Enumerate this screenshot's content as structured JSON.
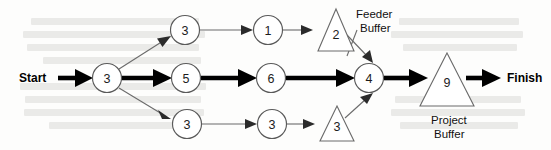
{
  "diagram": {
    "type": "project-network",
    "canvas": {
      "width": 551,
      "height": 150
    },
    "colors": {
      "critical_chain": "#000000",
      "feeding_path": "#6b6b6b",
      "node_fill": "#ffffff",
      "node_stroke": "#5a5a5a",
      "text": "#1c1c1c",
      "background": "#fdfdfc"
    },
    "endpoints": {
      "start_label": "Start",
      "finish_label": "Finish"
    },
    "captions": {
      "feeder_buffer_line1": "Feeder",
      "feeder_buffer_line2": "Buffer",
      "project_buffer_line1": "Project",
      "project_buffer_line2": "Buffer"
    },
    "nodes": [
      {
        "id": "t-start",
        "shape": "circle",
        "duration": "3",
        "cx": 107,
        "cy": 78,
        "r": 14.5,
        "chain": "critical"
      },
      {
        "id": "t-top-1",
        "shape": "circle",
        "duration": "3",
        "cx": 185,
        "cy": 30,
        "r": 14.5,
        "chain": "feeding"
      },
      {
        "id": "t-top-2",
        "shape": "circle",
        "duration": "1",
        "cx": 268,
        "cy": 30,
        "r": 14.5,
        "chain": "feeding"
      },
      {
        "id": "t-mid-1",
        "shape": "circle",
        "duration": "5",
        "cx": 186,
        "cy": 78,
        "r": 14.5,
        "chain": "critical"
      },
      {
        "id": "t-mid-2",
        "shape": "circle",
        "duration": "6",
        "cx": 271,
        "cy": 78,
        "r": 14.5,
        "chain": "critical"
      },
      {
        "id": "t-merge",
        "shape": "circle",
        "duration": "4",
        "cx": 369,
        "cy": 78,
        "r": 14.5,
        "chain": "critical"
      },
      {
        "id": "t-bot-1",
        "shape": "circle",
        "duration": "3",
        "cx": 187,
        "cy": 124,
        "r": 14.5,
        "chain": "feeding"
      },
      {
        "id": "t-bot-2",
        "shape": "circle",
        "duration": "3",
        "cx": 272,
        "cy": 124,
        "r": 14.5,
        "chain": "feeding"
      },
      {
        "id": "fb-top",
        "shape": "triangle",
        "duration": "2",
        "cx": 336,
        "cy": 30,
        "half_base": 18,
        "half_height": 21,
        "chain": "feeder-buffer"
      },
      {
        "id": "fb-bottom",
        "shape": "triangle",
        "duration": "3",
        "cx": 337,
        "cy": 124,
        "half_base": 17,
        "half_height": 18,
        "chain": "feeder-buffer"
      },
      {
        "id": "project-buf",
        "shape": "triangle",
        "duration": "9",
        "cx": 447,
        "cy": 81,
        "half_base": 27,
        "half_height": 27,
        "chain": "project-buffer"
      }
    ],
    "edges": [
      {
        "from": "Start",
        "to": "t-start",
        "style": "thick"
      },
      {
        "from": "t-start",
        "to": "t-mid-1",
        "style": "thick"
      },
      {
        "from": "t-mid-1",
        "to": "t-mid-2",
        "style": "thick"
      },
      {
        "from": "t-mid-2",
        "to": "t-merge",
        "style": "thick"
      },
      {
        "from": "t-merge",
        "to": "project-buf",
        "style": "thick"
      },
      {
        "from": "project-buf",
        "to": "Finish",
        "style": "thick"
      },
      {
        "from": "t-start",
        "to": "t-top-1",
        "style": "thin"
      },
      {
        "from": "t-top-1",
        "to": "t-top-2",
        "style": "thin"
      },
      {
        "from": "t-top-2",
        "to": "fb-top",
        "style": "thin"
      },
      {
        "from": "fb-top",
        "to": "t-merge",
        "style": "thin"
      },
      {
        "from": "t-start",
        "to": "t-bot-1",
        "style": "thin"
      },
      {
        "from": "t-bot-1",
        "to": "t-bot-2",
        "style": "thin"
      },
      {
        "from": "t-bot-2",
        "to": "fb-bottom",
        "style": "thin"
      },
      {
        "from": "fb-bottom",
        "to": "t-merge",
        "style": "thin"
      }
    ]
  }
}
